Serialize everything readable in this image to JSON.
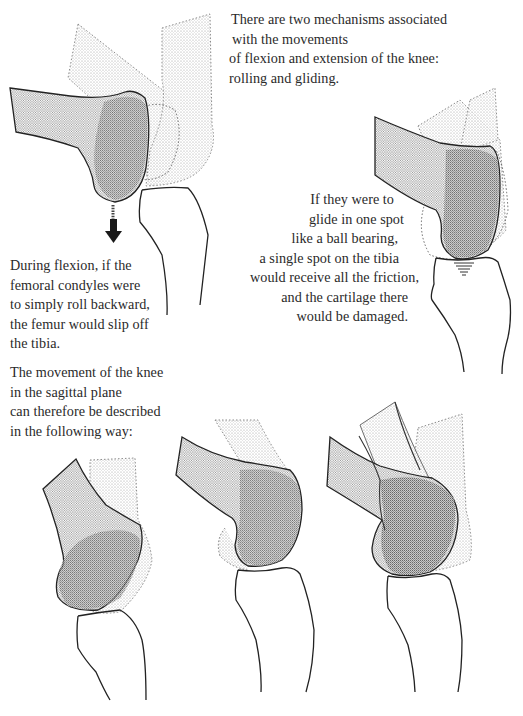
{
  "page": {
    "intro": {
      "lines": [
        "There are two mechanisms associated",
        "with the movements",
        "of flexion and extension of the knee:",
        "rolling and gliding."
      ]
    },
    "glide_note": {
      "lines": [
        "If they were to",
        "glide in one spot",
        "like a ball bearing,",
        "a single spot on the tibia",
        "would receive all the friction,",
        "and the cartilage there",
        "would be damaged."
      ]
    },
    "roll_note": {
      "lines": [
        "During flexion, if the",
        "femoral condyles were",
        "to simply roll backward,",
        "the femur would slip off",
        "the tibia."
      ]
    },
    "summary": {
      "lines": [
        "The movement of the knee",
        "in the sagittal plane",
        "can therefore be described",
        "in the following way:"
      ]
    }
  },
  "figures": [
    {
      "name": "rolling-only-figure",
      "depicts": "femoral condyles rolling backward off the tibia",
      "arrow": "down-arrow-icon"
    },
    {
      "name": "gliding-only-figure",
      "depicts": "femoral condyles gliding in one spot on the tibia"
    },
    {
      "name": "combined-motion-step-1",
      "depicts": "knee in extension"
    },
    {
      "name": "combined-motion-step-2",
      "depicts": "knee beginning flexion"
    },
    {
      "name": "combined-motion-step-3",
      "depicts": "knee in flexion, overlapping positions"
    }
  ],
  "colors": {
    "ink": "#222222",
    "stipple_light": "#bdbdbd",
    "stipple_mid": "#9a9a9a",
    "stipple_dark": "#6e6e6e"
  }
}
